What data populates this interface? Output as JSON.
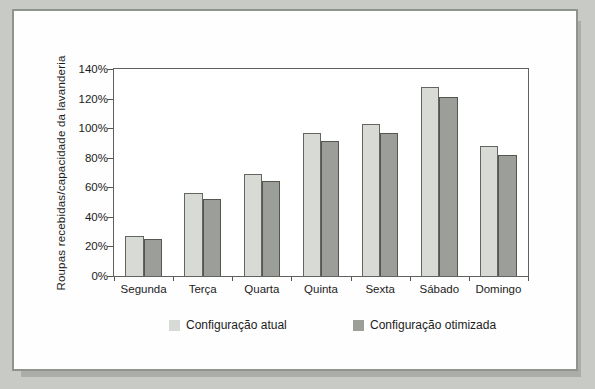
{
  "colors": {
    "page_background": "#c8cac5",
    "figure_background": "#fefefe",
    "figure_border": "#8f948f",
    "axis_line": "#5f625e",
    "text": "#1c1c1c"
  },
  "chart_data": {
    "type": "bar",
    "title": "",
    "xlabel": "",
    "ylabel": "Roupas recebidas/capacidade da lavanderia",
    "categories": [
      "Segunda",
      "Terça",
      "Quarta",
      "Quinta",
      "Sexta",
      "Sábado",
      "Domingo"
    ],
    "series": [
      {
        "name": "Configuração atual",
        "color": "#d8dad5",
        "border_color": "#63665f",
        "values": [
          27,
          56,
          69,
          97,
          103,
          128,
          88
        ]
      },
      {
        "name": "Configuração otimizada",
        "color": "#9c9e99",
        "border_color": "#54574f",
        "values": [
          25,
          52,
          64,
          91,
          97,
          121,
          82
        ]
      }
    ],
    "unit": "%",
    "ylim": [
      0,
      140
    ],
    "y_ticks": [
      "0%",
      "20%",
      "40%",
      "60%",
      "80%",
      "100%",
      "120%",
      "140%"
    ],
    "grid": false,
    "legend_position": "bottom-center"
  }
}
